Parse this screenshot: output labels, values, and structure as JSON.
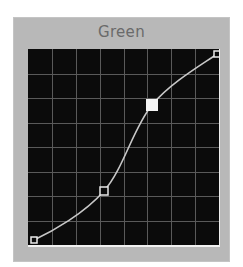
{
  "panel": {
    "title": "Green"
  },
  "curve_editor": {
    "channel": "Green",
    "grid": {
      "columns": 8,
      "rows": 8,
      "line_color": "#5a5a5a"
    },
    "background_color": "#0b0b0b",
    "curve_color": "#c8c8c8",
    "control_points": [
      {
        "id": "point-black",
        "x": 6,
        "y": 191,
        "selected": false,
        "style": "corner"
      },
      {
        "id": "point-lower",
        "x": 76,
        "y": 142,
        "selected": false,
        "style": "hollow"
      },
      {
        "id": "point-upper",
        "x": 124,
        "y": 56,
        "selected": true,
        "style": "filled"
      },
      {
        "id": "point-white",
        "x": 189,
        "y": 5,
        "selected": false,
        "style": "corner"
      }
    ]
  }
}
